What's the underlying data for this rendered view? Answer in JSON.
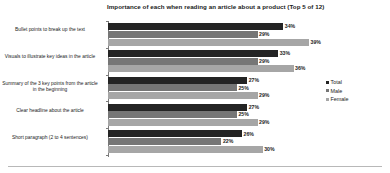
{
  "chart_data": {
    "type": "bar",
    "orientation": "horizontal",
    "title": "Importance of each when reading an article about a product (Top 5 of 12)",
    "xlabel": "",
    "ylabel": "",
    "grid": false,
    "legend_position": "right",
    "xlim": [
      0,
      45
    ],
    "value_suffix": "%",
    "categories": [
      "Bullet points to break up the text",
      "Visuals to illustrate key ideas in the article",
      "Summary of the 3 key points from the article in the beginning",
      "Clear headline about the article",
      "Short paragraph (2 to 4 sentences)"
    ],
    "series": [
      {
        "name": "Total",
        "color": "#242424",
        "values": [
          34,
          33,
          27,
          27,
          26
        ],
        "labels": [
          "34%",
          "33%",
          "27%",
          "27%",
          "26%"
        ]
      },
      {
        "name": "Male",
        "color": "#767676",
        "values": [
          29,
          29,
          25,
          25,
          22
        ],
        "labels": [
          "29%",
          "29%",
          "25%",
          "25%",
          "22%"
        ]
      },
      {
        "name": "Female",
        "color": "#a6a6a6",
        "values": [
          39,
          36,
          29,
          29,
          30
        ],
        "labels": [
          "39%",
          "36%",
          "29%",
          "29%",
          "30%"
        ]
      }
    ]
  },
  "legend": {
    "items": [
      {
        "label": "Total"
      },
      {
        "label": "Male"
      },
      {
        "label": "Female"
      }
    ]
  }
}
